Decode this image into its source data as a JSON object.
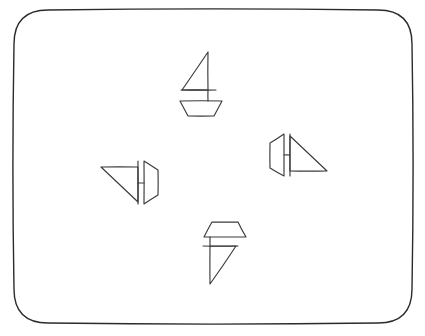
{
  "page": {
    "background_color": "#ffffff",
    "width": 425,
    "height": 336
  },
  "frame": {
    "name": "rounded-rectangle-border",
    "stroke_color": "#2b2b2b",
    "stroke_width": 1.4,
    "corner_radius": 34,
    "x": 14,
    "y": 10,
    "width": 398,
    "height": 313
  },
  "style": {
    "shape_stroke_color": "#3a3a3a",
    "shape_stroke_width": 1.15,
    "fill": "none"
  },
  "shapes": [
    {
      "id": "sailboat-top",
      "label": "Sailboat pointing up",
      "orientation_degrees": 0,
      "parts": [
        {
          "part": "sail-triangle",
          "type": "polygon",
          "points": "208,52 208,90 182,90"
        },
        {
          "part": "mast-line",
          "type": "line",
          "points": "181,90 216,90"
        },
        {
          "part": "hull-trapezoid",
          "type": "polygon",
          "points": "180,101 222,101 214,116 188,116"
        },
        {
          "part": "mast-vertical",
          "type": "line",
          "points": "208,90 208,101"
        }
      ]
    },
    {
      "id": "sailboat-left",
      "label": "Sailboat pointing left",
      "orientation_degrees": 90,
      "parts": [
        {
          "part": "sail-triangle",
          "type": "polygon",
          "points": "101,167 138,167 138,202"
        },
        {
          "part": "mast-line",
          "type": "line",
          "points": "138,161 138,204"
        },
        {
          "part": "hull-trapezoid",
          "type": "polygon",
          "points": "144,161 158,170 158,195 144,204"
        },
        {
          "part": "mast-vertical",
          "type": "line",
          "points": "138,183 144,183"
        }
      ]
    },
    {
      "id": "sailboat-right",
      "label": "Sailboat pointing right",
      "orientation_degrees": -90,
      "parts": [
        {
          "part": "sail-triangle",
          "type": "polygon",
          "points": "290,136 290,171 327,171"
        },
        {
          "part": "mast-line",
          "type": "line",
          "points": "290,134 290,176"
        },
        {
          "part": "hull-trapezoid",
          "type": "polygon",
          "points": "284,134 270,143 270,168 284,176"
        },
        {
          "part": "mast-vertical",
          "type": "line",
          "points": "284,155 290,155"
        }
      ]
    },
    {
      "id": "sailboat-bottom",
      "label": "Sailboat pointing down",
      "orientation_degrees": 180,
      "parts": [
        {
          "part": "sail-triangle",
          "type": "polygon",
          "points": "210,246 210,284 236,246"
        },
        {
          "part": "mast-line",
          "type": "line",
          "points": "203,246 238,246"
        },
        {
          "part": "hull-trapezoid",
          "type": "polygon",
          "points": "212,222 238,222 246,237 204,237"
        },
        {
          "part": "mast-vertical",
          "type": "line",
          "points": "210,237 210,246"
        }
      ]
    }
  ]
}
